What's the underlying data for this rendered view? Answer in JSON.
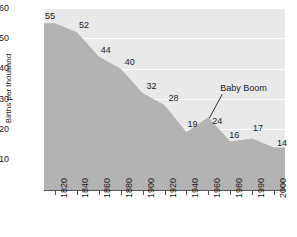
{
  "chart_data": {
    "type": "area",
    "title": "",
    "xlabel": "",
    "ylabel": "Births per thousand",
    "ylim": [
      0,
      60
    ],
    "grid": true,
    "legend": "none",
    "categories": [
      "1820",
      "1840",
      "1860",
      "1880",
      "1900",
      "1920",
      "1940",
      "1960",
      "1980",
      "1990",
      "2000"
    ],
    "values": [
      55,
      52,
      44,
      40,
      32,
      28,
      19,
      24,
      16,
      17,
      14
    ],
    "point_labels": [
      "55",
      "52",
      "44",
      "40",
      "32",
      "28",
      "19",
      "24",
      "16",
      "17",
      "14"
    ],
    "y_ticks": [
      "60",
      "50",
      "40",
      "30",
      "20",
      "10"
    ],
    "y_tick_values": [
      60,
      50,
      40,
      30,
      20,
      10
    ],
    "annotations": [
      {
        "text": "Baby Boom",
        "points_to_category": "1960",
        "points_to_value": 24
      }
    ],
    "colors": {
      "plot_background": "#e9e9e9",
      "area_fill": "#b3b3b3",
      "gridline": "#ffffff",
      "axis": "#555555",
      "text": "#1a1a1a",
      "page_background": "#ffffff"
    }
  }
}
